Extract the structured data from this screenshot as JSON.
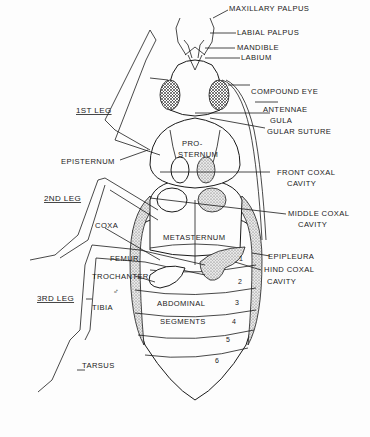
{
  "labels": {
    "maxillary_palpus": "MAXILLARY PALPUS",
    "labial_palpus": "LABIAL PALPUS",
    "mandible": "MANDIBLE",
    "labium": "LABIUM",
    "compound_eye": "COMPOUND EYE",
    "antennae": "ANTENNAE",
    "gula": "GULA",
    "gular_suture": "GULAR SUTURE",
    "front_coxal_cavity_1": "FRONT COXAL",
    "front_coxal_cavity_2": "CAVITY",
    "middle_coxal_cavity_1": "MIDDLE COXAL",
    "middle_coxal_cavity_2": "CAVITY",
    "epipleura": "EPIPLEURA",
    "hind_coxal_cavity_1": "HIND COXAL",
    "hind_coxal_cavity_2": "CAVITY",
    "first_leg": "1ST LEG",
    "episternum": "EPISTERNUM",
    "second_leg": "2ND LEG",
    "coxa": "COXA",
    "femur": "FEMUR",
    "trochanter": "TROCHANTER",
    "third_leg": "3RD LEG",
    "tibia": "TIBIA",
    "tarsus": "TARSUS",
    "prosternum_1": "PRO-",
    "prosternum_2": "STERNUM",
    "metasternum": "METASTERNUM",
    "abdominal": "ABDOMINAL",
    "segments": "SEGMENTS",
    "sex_symbol": "♂"
  },
  "segment_numbers": [
    "1",
    "2",
    "3",
    "4",
    "5",
    "6"
  ]
}
